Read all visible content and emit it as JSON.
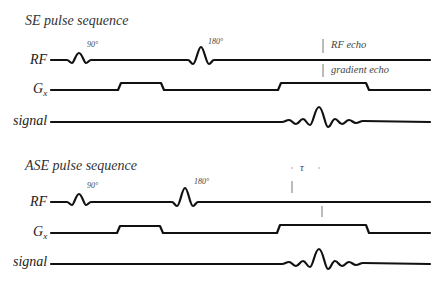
{
  "diagrams": [
    {
      "title": "SE pulse sequence",
      "rows": {
        "rf": "RF",
        "gx_main": "G",
        "gx_sub": "x",
        "signal": "signal"
      },
      "pulse_labels": {
        "p90": "90°",
        "p180": "180°"
      },
      "annotations": {
        "rf_echo": "RF echo",
        "gradient_echo": "gradient echo"
      }
    },
    {
      "title": "ASE pulse sequence",
      "rows": {
        "rf": "RF",
        "gx_main": "G",
        "gx_sub": "x",
        "signal": "signal"
      },
      "pulse_labels": {
        "p90": "90°",
        "p180": "180°"
      },
      "annotations": {
        "tau": "τ"
      }
    }
  ],
  "colors": {
    "line": "#111111",
    "text": "#333333",
    "marker": "#666666"
  }
}
